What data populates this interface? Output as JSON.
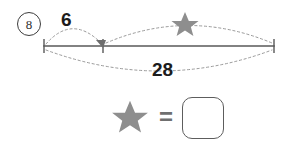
{
  "problem": {
    "number": "8"
  },
  "diagram": {
    "type": "number-line-part-whole",
    "line": {
      "color": "#585858",
      "x_start": 44,
      "x_end": 274,
      "y": 46
    },
    "ticks": [
      {
        "name": "tick-left",
        "x": 44,
        "value": ""
      },
      {
        "name": "tick-middle",
        "x": 103,
        "value": ""
      },
      {
        "name": "tick-right",
        "x": 274,
        "value": ""
      }
    ],
    "arcs": [
      {
        "name": "arc-known-part",
        "position": "above",
        "from_tick": "tick-left",
        "to_tick": "tick-middle",
        "label": "6",
        "label_kind": "number",
        "style": "dotted",
        "color": "#9a9a9a"
      },
      {
        "name": "arc-unknown-part",
        "position": "above",
        "from_tick": "tick-middle",
        "to_tick": "tick-right",
        "label": "star",
        "label_kind": "star",
        "style": "dotted",
        "color": "#9a9a9a"
      },
      {
        "name": "arc-total",
        "position": "below",
        "from_tick": "tick-left",
        "to_tick": "tick-right",
        "label": "28",
        "label_kind": "number",
        "style": "dotted",
        "color": "#9a9a9a"
      }
    ],
    "arrowhead": {
      "name": "arrowhead-middle",
      "x": 103,
      "y": 46,
      "direction": "left-down",
      "color": "#6d6d6d"
    }
  },
  "labels": {
    "top_left_value": "6",
    "bottom_total": "28"
  },
  "answer": {
    "star_symbol": "star",
    "equals": "=",
    "value": "",
    "placeholder": ""
  },
  "colors": {
    "star_fill": "#8e8e8e",
    "line": "#585858",
    "dotted": "#9a9a9a",
    "text": "#1c1c1c",
    "box_border": "#5d5d5d"
  }
}
